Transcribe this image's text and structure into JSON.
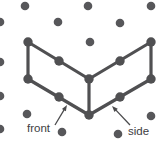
{
  "diagram": {
    "background": "#ffffff",
    "dot_color": "#57575a",
    "line_color": "#505052",
    "arrow_color": "#4a4a4c",
    "text_color": "#3d3d3f",
    "font_size": 11.5,
    "grid_dot_radius": 4.3,
    "vertex_dot_radius": 4.7,
    "edge_width": 3.2,
    "arrow_width": 1.3,
    "grid_dots": [
      [
        25,
        6
      ],
      [
        88,
        6
      ],
      [
        151,
        6
      ],
      [
        0,
        22
      ],
      [
        58,
        22
      ],
      [
        120,
        23
      ],
      [
        90,
        42
      ],
      [
        0,
        62
      ],
      [
        0,
        96
      ],
      [
        27,
        114
      ],
      [
        151,
        116
      ],
      [
        0,
        129
      ],
      [
        62,
        132
      ],
      [
        118,
        134
      ]
    ],
    "vertex_dots": [
      [
        28,
        42
      ],
      [
        151,
        42
      ],
      [
        59,
        61
      ],
      [
        120,
        61
      ],
      [
        28,
        79
      ],
      [
        89,
        79
      ],
      [
        151,
        79
      ],
      [
        59,
        97
      ],
      [
        120,
        97
      ],
      [
        89,
        115
      ]
    ],
    "edges": [
      [
        [
          28,
          42
        ],
        [
          28,
          79
        ]
      ],
      [
        [
          28,
          42
        ],
        [
          89,
          79
        ]
      ],
      [
        [
          151,
          42
        ],
        [
          151,
          79
        ]
      ],
      [
        [
          151,
          42
        ],
        [
          89,
          79
        ]
      ],
      [
        [
          89,
          79
        ],
        [
          89,
          115
        ]
      ],
      [
        [
          28,
          79
        ],
        [
          89,
          115
        ]
      ],
      [
        [
          151,
          79
        ],
        [
          89,
          115
        ]
      ]
    ],
    "arrows": [
      {
        "name": "front-arrow",
        "from": [
          55,
          125
        ],
        "to": [
          67,
          105
        ]
      },
      {
        "name": "side-arrow",
        "from": [
          130,
          125
        ],
        "to": [
          112,
          106
        ]
      }
    ],
    "labels": [
      {
        "name": "front-label",
        "text": "front",
        "x": 27,
        "y": 131.5
      },
      {
        "name": "side-label",
        "text": "side",
        "x": 128,
        "y": 134.5
      }
    ]
  }
}
